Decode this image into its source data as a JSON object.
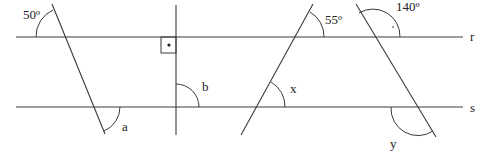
{
  "diagram": {
    "title": "",
    "colors": {
      "stroke": "#3a3a3a",
      "text": "#222222",
      "background": "#ffffff"
    },
    "parallel_lines": [
      {
        "name": "r",
        "label": "r",
        "y": 37,
        "x1": 16,
        "x2": 463
      },
      {
        "name": "s",
        "label": "s",
        "y": 107,
        "x1": 16,
        "x2": 463
      }
    ],
    "transversals": [
      {
        "id": "t1",
        "x1": 52,
        "y1": 4,
        "x2": 105,
        "y2": 134
      },
      {
        "id": "t2",
        "x1": 176,
        "y1": 5,
        "x2": 176,
        "y2": 135
      },
      {
        "id": "t3",
        "x1": 313,
        "y1": 4,
        "x2": 241,
        "y2": 135
      },
      {
        "id": "t4",
        "x1": 356,
        "y1": 4,
        "x2": 436,
        "y2": 137
      }
    ],
    "angle_labels": {
      "t1_given": "50º",
      "t1_unknown": "a",
      "t2_unknown": "b",
      "t3_given": "55º",
      "t3_unknown": "x",
      "t4_given": "140º",
      "t4_unknown": "y"
    },
    "right_angle_marker": {
      "x": 161,
      "y": 37,
      "size": 15,
      "has_dot": true
    }
  }
}
